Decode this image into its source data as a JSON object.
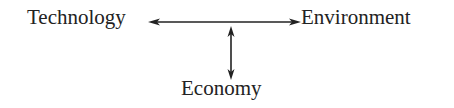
{
  "diagram": {
    "nodes": [
      {
        "id": "technology",
        "label": "Technology"
      },
      {
        "id": "environment",
        "label": "Environment"
      },
      {
        "id": "economy",
        "label": "Economy"
      }
    ],
    "edges": [
      {
        "from": "technology",
        "to": "environment",
        "type": "bidirectional",
        "orientation": "horizontal"
      },
      {
        "from": "economy",
        "to": "technology-environment-link",
        "type": "bidirectional",
        "orientation": "vertical"
      }
    ],
    "colors": {
      "text": "#222222",
      "arrow": "#222222",
      "background": "#ffffff"
    }
  }
}
